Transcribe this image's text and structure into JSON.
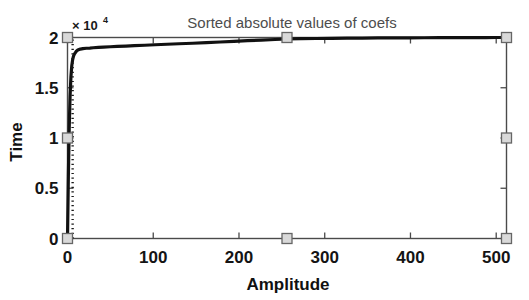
{
  "chart_data": {
    "type": "line",
    "title": "Sorted absolute values of coefs",
    "xlabel": "Amplitude",
    "ylabel": "Time",
    "xlim": [
      0,
      512
    ],
    "ylim": [
      0,
      20000
    ],
    "xticks": [
      0,
      100,
      200,
      300,
      400,
      500
    ],
    "xticklabels": [
      "0",
      "100",
      "200",
      "300",
      "400",
      "500"
    ],
    "yticks": [
      0,
      5000,
      10000,
      15000,
      20000
    ],
    "yticklabels": [
      "0",
      "0.5",
      "1",
      "1.5",
      "2"
    ],
    "y_exponent_base": "× 10",
    "y_exponent_power": "4",
    "y_exponent_value": 10000,
    "grid": false,
    "legend": null,
    "series": [
      {
        "name": "sorted absolute values of coefs",
        "style": "solid",
        "color": "#111111",
        "width": 3.2,
        "x": [
          0,
          1,
          2,
          3,
          4,
          5,
          6,
          7,
          8,
          10,
          12,
          15,
          18,
          22,
          26,
          30,
          36,
          42,
          50,
          58,
          68,
          78,
          90,
          102,
          116,
          130,
          146,
          162,
          178,
          194,
          210,
          226,
          242,
          256,
          272,
          290,
          308,
          326,
          344,
          362,
          380,
          398,
          416,
          434,
          452,
          470,
          488,
          500,
          506,
          512
        ],
        "y": [
          0,
          6200,
          11000,
          14200,
          16100,
          17200,
          17800,
          18150,
          18350,
          18600,
          18750,
          18850,
          18900,
          18930,
          18950,
          18980,
          19010,
          19040,
          19080,
          19110,
          19150,
          19190,
          19230,
          19280,
          19330,
          19380,
          19430,
          19490,
          19550,
          19620,
          19680,
          19740,
          19800,
          19850,
          19880,
          19900,
          19920,
          19935,
          19945,
          19955,
          19962,
          19970,
          19976,
          19982,
          19987,
          19991,
          19995,
          19998,
          19999,
          20000
        ]
      },
      {
        "name": "threshold-marker",
        "style": "dotted",
        "color": "#1a1a1a",
        "width": 2.4,
        "x": [
          6,
          6
        ],
        "y": [
          0,
          20000
        ]
      }
    ],
    "markers": [
      {
        "x": 0,
        "y": 20000,
        "shape": "square"
      },
      {
        "x": 256,
        "y": 20000,
        "shape": "square"
      },
      {
        "x": 512,
        "y": 20000,
        "shape": "square"
      },
      {
        "x": 0,
        "y": 10000,
        "shape": "square"
      },
      {
        "x": 512,
        "y": 10000,
        "shape": "square"
      },
      {
        "x": 0,
        "y": 0,
        "shape": "square"
      },
      {
        "x": 256,
        "y": 0,
        "shape": "square"
      },
      {
        "x": 512,
        "y": 0,
        "shape": "square"
      }
    ],
    "colors": {
      "axis": "#4a4a4a",
      "curve": "#111111",
      "marker_fill": "#d9d9d9",
      "marker_stroke": "#666666",
      "background": "#ffffff",
      "title": "#4d4d4d",
      "label": "#111111"
    }
  }
}
